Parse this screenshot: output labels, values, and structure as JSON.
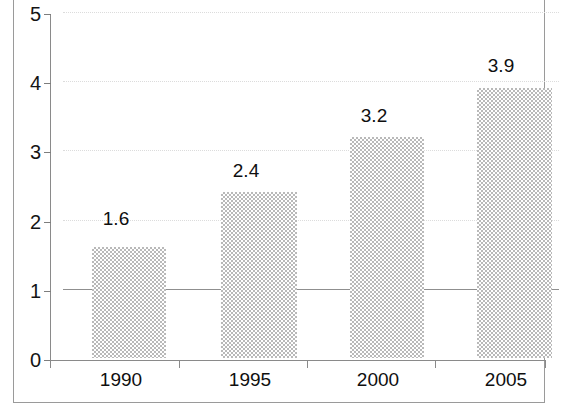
{
  "chart_data": {
    "type": "bar",
    "title": "",
    "subtitle": "",
    "xlabel": "",
    "ylabel": "",
    "categories": [
      "1990",
      "1995",
      "2000",
      "2005"
    ],
    "values": [
      1.6,
      2.4,
      3.2,
      3.9
    ],
    "value_labels": [
      "1.6",
      "2.4",
      "3.2",
      "3.9"
    ],
    "series": [
      {
        "name": "",
        "values": [
          1.6,
          2.4,
          3.2,
          3.9
        ]
      }
    ],
    "ylim": [
      0,
      5
    ],
    "y_ticks": [
      0,
      1,
      2,
      3,
      4,
      5
    ],
    "y_tick_labels": [
      "0",
      "1",
      "2",
      "3",
      "4",
      "5"
    ],
    "grid": true,
    "grid_axis": "y",
    "legend": false,
    "legend_position": "none",
    "annotations": []
  },
  "style": {
    "bar_fill": "#b9b9b9",
    "bar_pattern": "halftone-checker",
    "grid_color": "#dcdcdc",
    "axis_color": "#8a8a8a",
    "text_color": "#0f0f0f",
    "frame_color": "#9a9a9a",
    "background": "#ffffff"
  },
  "geometry": {
    "bars": [
      {
        "left": 78,
        "width": 74,
        "label_center": 115
      },
      {
        "left": 207,
        "width": 76,
        "label_center": 245
      },
      {
        "left": 336,
        "width": 74,
        "label_center": 373
      },
      {
        "left": 463,
        "width": 75,
        "label_center": 500
      }
    ],
    "y_tick_pixels": [
      360,
      291,
      222,
      152,
      83,
      14
    ],
    "x_tick_pixels": [
      49,
      178,
      306,
      434,
      544
    ],
    "plot_top": 14,
    "plot_bottom": 360
  }
}
